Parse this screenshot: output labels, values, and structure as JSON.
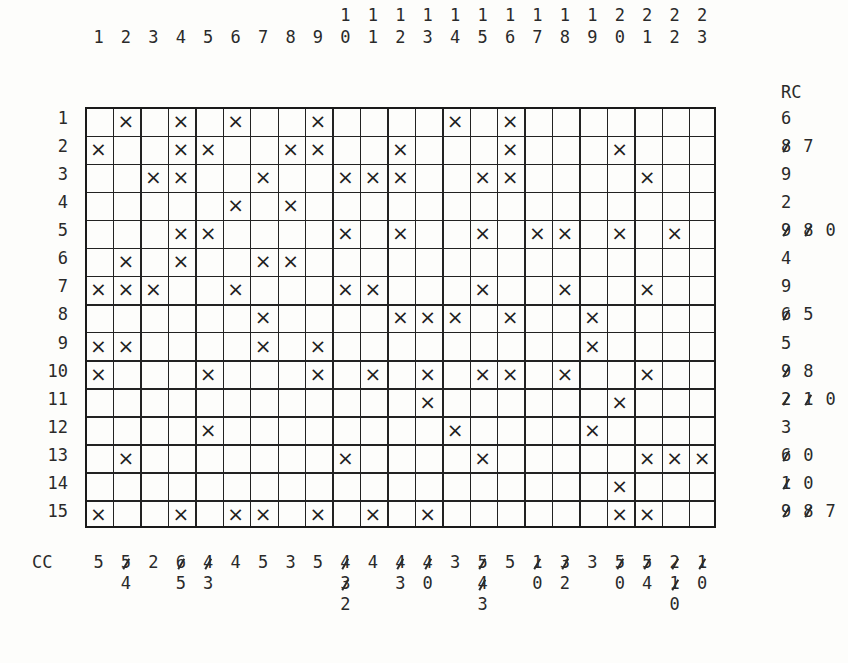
{
  "column_headers": [
    "1",
    "2",
    "3",
    "4",
    "5",
    "6",
    "7",
    "8",
    "9",
    "10",
    "11",
    "12",
    "13",
    "14",
    "15",
    "16",
    "17",
    "18",
    "19",
    "20",
    "21",
    "22",
    "23"
  ],
  "row_labels": [
    "1",
    "2",
    "3",
    "4",
    "5",
    "6",
    "7",
    "8",
    "9",
    "10",
    "11",
    "12",
    "13",
    "14",
    "15"
  ],
  "mark_symbol": "×",
  "grid": {
    "rows": 15,
    "cols": 23,
    "marks": [
      [
        2,
        4,
        6,
        9,
        14,
        16
      ],
      [
        1,
        4,
        5,
        8,
        9,
        12,
        16,
        20
      ],
      [
        3,
        4,
        7,
        10,
        11,
        12,
        15,
        16,
        21
      ],
      [
        6,
        8
      ],
      [
        4,
        5,
        10,
        12,
        15,
        17,
        18,
        20,
        22
      ],
      [
        2,
        4,
        7,
        8
      ],
      [
        1,
        2,
        3,
        6,
        10,
        11,
        15,
        18,
        21
      ],
      [
        7,
        12,
        13,
        14,
        16,
        19
      ],
      [
        1,
        2,
        7,
        9,
        19
      ],
      [
        1,
        5,
        9,
        11,
        13,
        15,
        16,
        18,
        21
      ],
      [
        13,
        20
      ],
      [
        5,
        14,
        19
      ],
      [
        2,
        10,
        15,
        21,
        22,
        23
      ],
      [
        20
      ],
      [
        1,
        4,
        6,
        7,
        9,
        11,
        13,
        20,
        21
      ]
    ]
  },
  "row_counts": {
    "title": "RC",
    "values": [
      [
        {
          "v": "6",
          "struck": false
        }
      ],
      [
        {
          "v": "8",
          "struck": true
        },
        {
          "v": "7",
          "struck": false
        }
      ],
      [
        {
          "v": "9",
          "struck": false
        }
      ],
      [
        {
          "v": "2",
          "struck": false
        }
      ],
      [
        {
          "v": "9",
          "struck": true
        },
        {
          "v": "8",
          "struck": true
        },
        {
          "v": "0",
          "struck": false
        }
      ],
      [
        {
          "v": "4",
          "struck": false
        }
      ],
      [
        {
          "v": "9",
          "struck": false
        }
      ],
      [
        {
          "v": "6",
          "struck": true
        },
        {
          "v": "5",
          "struck": false
        }
      ],
      [
        {
          "v": "5",
          "struck": false
        }
      ],
      [
        {
          "v": "9",
          "struck": true
        },
        {
          "v": "8",
          "struck": false
        }
      ],
      [
        {
          "v": "2",
          "struck": true
        },
        {
          "v": "1",
          "struck": true
        },
        {
          "v": "0",
          "struck": false
        }
      ],
      [
        {
          "v": "3",
          "struck": false
        }
      ],
      [
        {
          "v": "6",
          "struck": true
        },
        {
          "v": "0",
          "struck": false
        }
      ],
      [
        {
          "v": "1",
          "struck": true
        },
        {
          "v": "0",
          "struck": false
        }
      ],
      [
        {
          "v": "9",
          "struck": true
        },
        {
          "v": "8",
          "struck": true
        },
        {
          "v": "7",
          "struck": false
        }
      ]
    ]
  },
  "column_counts": {
    "title": "CC",
    "values": [
      [
        {
          "v": "5",
          "struck": false
        }
      ],
      [
        {
          "v": "5",
          "struck": true
        },
        {
          "v": "4",
          "struck": false
        }
      ],
      [
        {
          "v": "2",
          "struck": false
        }
      ],
      [
        {
          "v": "6",
          "struck": true
        },
        {
          "v": "5",
          "struck": false
        }
      ],
      [
        {
          "v": "4",
          "struck": true
        },
        {
          "v": "3",
          "struck": false
        }
      ],
      [
        {
          "v": "4",
          "struck": false
        }
      ],
      [
        {
          "v": "5",
          "struck": false
        }
      ],
      [
        {
          "v": "3",
          "struck": false
        }
      ],
      [
        {
          "v": "5",
          "struck": false
        }
      ],
      [
        {
          "v": "4",
          "struck": true
        },
        {
          "v": "3",
          "struck": true
        },
        {
          "v": "2",
          "struck": false
        }
      ],
      [
        {
          "v": "4",
          "struck": false
        }
      ],
      [
        {
          "v": "4",
          "struck": true
        },
        {
          "v": "3",
          "struck": false
        }
      ],
      [
        {
          "v": "4",
          "struck": true
        },
        {
          "v": "0",
          "struck": false
        }
      ],
      [
        {
          "v": "3",
          "struck": false
        }
      ],
      [
        {
          "v": "5",
          "struck": true
        },
        {
          "v": "4",
          "struck": true
        },
        {
          "v": "3",
          "struck": false
        }
      ],
      [
        {
          "v": "5",
          "struck": false
        }
      ],
      [
        {
          "v": "1",
          "struck": true
        },
        {
          "v": "0",
          "struck": false
        }
      ],
      [
        {
          "v": "3",
          "struck": true
        },
        {
          "v": "2",
          "struck": false
        }
      ],
      [
        {
          "v": "3",
          "struck": false
        }
      ],
      [
        {
          "v": "5",
          "struck": true
        },
        {
          "v": "0",
          "struck": false
        }
      ],
      [
        {
          "v": "5",
          "struck": true
        },
        {
          "v": "4",
          "struck": false
        }
      ],
      [
        {
          "v": "2",
          "struck": true
        },
        {
          "v": "1",
          "struck": true
        },
        {
          "v": "0",
          "struck": false
        }
      ],
      [
        {
          "v": "1",
          "struck": true
        },
        {
          "v": "0",
          "struck": false
        }
      ]
    ]
  }
}
